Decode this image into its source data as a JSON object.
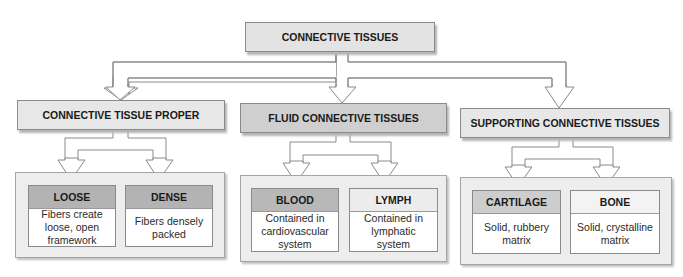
{
  "diagram": {
    "root": {
      "label": "CONNECTIVE TISSUES"
    },
    "categories": [
      {
        "label": "CONNECTIVE TISSUE PROPER",
        "types": [
          {
            "name": "LOOSE",
            "description": "Fibers create loose, open framework",
            "header_color": "#b3b3b3"
          },
          {
            "name": "DENSE",
            "description": "Fibers densely packed",
            "header_color": "#b3b3b3"
          }
        ]
      },
      {
        "label": "FLUID CONNECTIVE TISSUES",
        "types": [
          {
            "name": "BLOOD",
            "description": "Contained in cardiovascular system",
            "header_color": "#b8b8b8"
          },
          {
            "name": "LYMPH",
            "description": "Contained in lymphatic system",
            "header_color": "#ececec"
          }
        ]
      },
      {
        "label": "SUPPORTING CONNECTIVE TISSUES",
        "types": [
          {
            "name": "CARTILAGE",
            "description": "Solid, rubbery matrix",
            "header_color": "#cdcdcd"
          },
          {
            "name": "BONE",
            "description": "Solid, crystalline matrix",
            "header_color": "#f3f3f3"
          }
        ]
      }
    ]
  }
}
